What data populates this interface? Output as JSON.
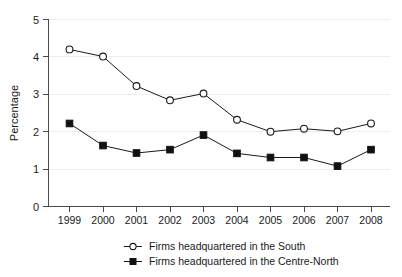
{
  "chart_data": {
    "type": "line",
    "title": "",
    "xlabel": "",
    "ylabel": "Percentage",
    "categories": [
      "1999",
      "2000",
      "2001",
      "2002",
      "2003",
      "2004",
      "2005",
      "2006",
      "2007",
      "2008"
    ],
    "x": [
      1999,
      2000,
      2001,
      2002,
      2003,
      2004,
      2005,
      2006,
      2007,
      2008
    ],
    "ylim": [
      0,
      5
    ],
    "yticks": [
      "0",
      "1",
      "2",
      "3",
      "4",
      "5"
    ],
    "ytick_values": [
      0,
      1,
      2,
      3,
      4,
      5
    ],
    "grid": "horizontal",
    "legend_position": "bottom-center",
    "series": [
      {
        "name": "Firms headquartered in the South",
        "marker": "open-circle",
        "color": "#1a1a1a",
        "values": [
          4.2,
          4.01,
          3.22,
          2.84,
          3.02,
          2.32,
          2.0,
          2.08,
          2.01,
          2.22
        ]
      },
      {
        "name": "Firms headquartered in the Centre-North",
        "marker": "filled-square",
        "color": "#111111",
        "values": [
          2.22,
          1.63,
          1.43,
          1.52,
          1.91,
          1.42,
          1.31,
          1.31,
          1.08,
          1.52
        ]
      }
    ]
  },
  "axis": {
    "y_label": "Percentage",
    "y_tick_0": "0",
    "y_tick_1": "1",
    "y_tick_2": "2",
    "y_tick_3": "3",
    "y_tick_4": "4",
    "y_tick_5": "5"
  },
  "xaxis": {
    "t0": "1999",
    "t1": "2000",
    "t2": "2001",
    "t3": "2002",
    "t4": "2003",
    "t5": "2004",
    "t6": "2005",
    "t7": "2006",
    "t8": "2007",
    "t9": "2008"
  },
  "legend": {
    "entry_south": "Firms headquartered in the South",
    "entry_centre_north": "Firms headquartered in the Centre-North"
  }
}
